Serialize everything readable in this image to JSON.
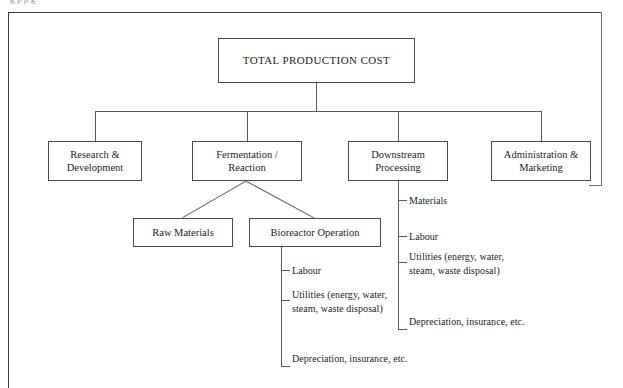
{
  "figure": {
    "clipped_caption": "g                                                      p                                   p                        g"
  },
  "diagram": {
    "type": "hierarchical-cost-breakdown-tree",
    "root": {
      "id": "total-production-cost",
      "label": "TOTAL PRODUCTION COST"
    },
    "level2": [
      {
        "id": "research-development",
        "line1": "Research &",
        "line2": "Development"
      },
      {
        "id": "fermentation-reaction",
        "line1": "Fermentation /",
        "line2": "Reaction"
      },
      {
        "id": "downstream-processing",
        "line1": "Downstream",
        "line2": "Processing"
      },
      {
        "id": "administration-marketing",
        "line1": "Administration &",
        "line2": "Marketing"
      }
    ],
    "level3": [
      {
        "id": "raw-materials",
        "label": "Raw Materials"
      },
      {
        "id": "bioreactor-operation",
        "label": "Bioreactor Operation"
      }
    ],
    "bioreactor_leaves": [
      {
        "id": "bio-labour",
        "line1": "Labour",
        "line2": ""
      },
      {
        "id": "bio-utilities",
        "line1": "Utilities (energy, water,",
        "line2": "steam, waste disposal)"
      },
      {
        "id": "bio-depreciation",
        "line1": "Depreciation, insurance,",
        "line2": "etc."
      }
    ],
    "downstream_leaves": [
      {
        "id": "ds-materials",
        "line1": "Materials",
        "line2": ""
      },
      {
        "id": "ds-labour",
        "line1": "Labour",
        "line2": ""
      },
      {
        "id": "ds-utilities",
        "line1": "Utilities (energy, water,",
        "line2": "steam, waste disposal)"
      },
      {
        "id": "ds-depreciation",
        "line1": "Depreciation,",
        "line2": "insurance, etc."
      }
    ]
  },
  "colors": {
    "frame": "#3a3a3a",
    "box_border": "#4a4a4a",
    "connector": "#5a5a5a",
    "text": "#1d1d1d",
    "background": "#ffffff"
  }
}
